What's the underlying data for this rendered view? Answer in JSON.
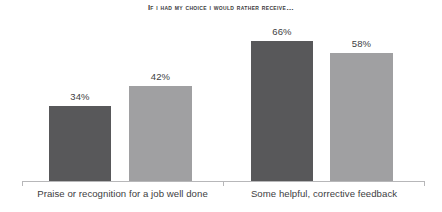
{
  "chart_data": {
    "type": "bar",
    "title": "If I had my choice I would rather receive…",
    "xlabel": "",
    "ylabel": "",
    "ylim": [
      0,
      100
    ],
    "grid": false,
    "legend": "none",
    "categories": [
      "Praise or recognition for a job well done",
      "Some helpful, corrective feedback"
    ],
    "series": [
      {
        "name": "Series 1",
        "color": "#58585a",
        "values": [
          34,
          58
        ]
      },
      {
        "name": "Series 2",
        "color": "#a0a0a2",
        "values": [
          42,
          58
        ]
      }
    ],
    "bars": [
      {
        "label": "34%",
        "value": 34,
        "category": "Praise or recognition for a job well done",
        "color": "#58585a",
        "left": 49,
        "width": 62,
        "height": 75
      },
      {
        "label": "42%",
        "value": 42,
        "category": "Praise or recognition for a job well done",
        "color": "#a0a0a2",
        "left": 129,
        "width": 63,
        "height": 95
      },
      {
        "label": "66%",
        "value": 66,
        "category": "Some helpful, corrective feedback",
        "color": "#58585a",
        "left": 251,
        "width": 62,
        "height": 140
      },
      {
        "label": "58%",
        "value": 58,
        "category": "Some helpful, corrective feedback",
        "color": "#a0a0a2",
        "left": 330,
        "width": 63,
        "height": 128
      }
    ],
    "axis": {
      "baseline_color": "#b7b7b9",
      "ticks": [
        "left",
        "middle",
        "right"
      ]
    }
  }
}
